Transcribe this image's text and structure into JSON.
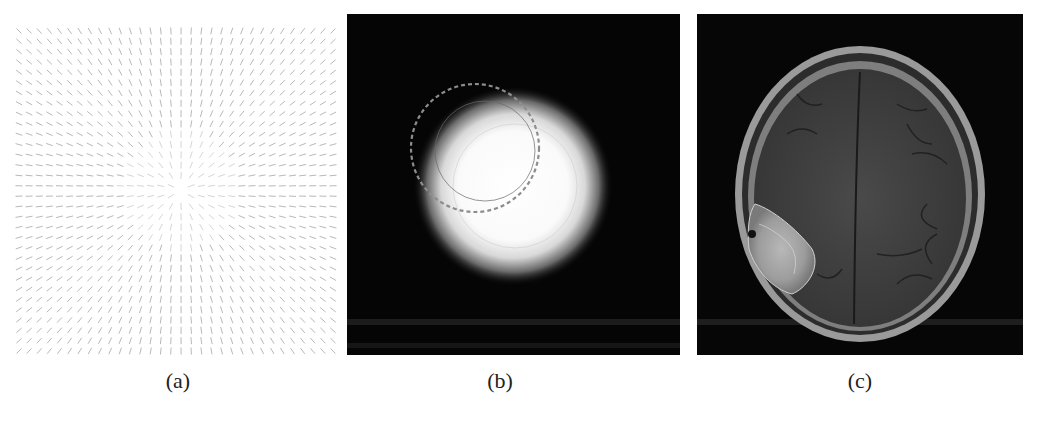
{
  "figure": {
    "panels": [
      {
        "id": "a",
        "caption": "(a)",
        "content": "vector field converging to a central point"
      },
      {
        "id": "b",
        "caption": "(b)",
        "content": "glowing white disc on black background with dashed and faint contour circles"
      },
      {
        "id": "c",
        "caption": "(c)",
        "content": "axial brain MRI slice with bright lesion on left side"
      }
    ]
  },
  "colors": {
    "arrow": "#8a8a8a",
    "panel_background": "#050505",
    "dashed_contour": "#9a9a9a",
    "glow_core": "#ffffff"
  },
  "vector_field": {
    "grid_cols": 32,
    "grid_rows": 32,
    "center": [
      166,
      164
    ],
    "arrow_length": 7
  }
}
